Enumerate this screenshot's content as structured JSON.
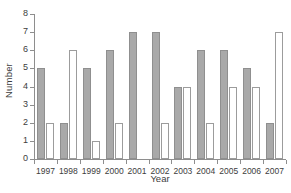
{
  "chart_data": {
    "type": "bar",
    "title": "",
    "xlabel": "Year",
    "ylabel": "Number",
    "categories": [
      "1997",
      "1998",
      "1999",
      "2000",
      "2001",
      "2002",
      "2003",
      "2004",
      "2005",
      "2006",
      "2007"
    ],
    "series": [
      {
        "name": "gray-filled",
        "color": "#a9a9a9",
        "values": [
          5,
          2,
          5,
          6,
          7,
          7,
          4,
          6,
          6,
          5,
          2
        ]
      },
      {
        "name": "white-outlined",
        "color": "#ffffff",
        "values": [
          2,
          6,
          1,
          2,
          0,
          2,
          4,
          2,
          4,
          4,
          7
        ]
      }
    ],
    "ylim": [
      0,
      8
    ],
    "ytick_labels": [
      "0",
      "1",
      "2",
      "3",
      "4",
      "5",
      "6",
      "7",
      "8"
    ],
    "grid": false,
    "legend": false,
    "axis_color": "#8e8e8e"
  }
}
